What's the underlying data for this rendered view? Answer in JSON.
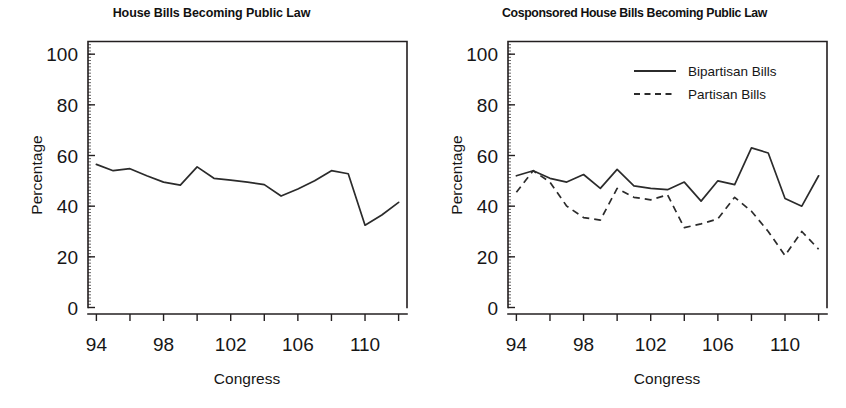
{
  "figure": {
    "background": "#ffffff",
    "ink_color": "#231f20"
  },
  "panels": [
    {
      "id": "left",
      "title": "House Bills Becoming Public Law",
      "xlabel": "Congress",
      "ylabel": "Percentage",
      "has_legend": false
    },
    {
      "id": "right",
      "title": "Cosponsored House Bills Becoming Public Law",
      "xlabel": "Congress",
      "ylabel": "Percentage",
      "has_legend": true,
      "legend": [
        {
          "label": "Bipartisan Bills",
          "style": "solid"
        },
        {
          "label": "Partisan Bills",
          "style": "dashed"
        }
      ]
    }
  ],
  "axes": {
    "y_ticks": [
      "0",
      "20",
      "40",
      "60",
      "80",
      "100"
    ],
    "y_tick_values": [
      0,
      20,
      40,
      60,
      80,
      100
    ],
    "x_ticks": [
      "94",
      "98",
      "102",
      "106",
      "110"
    ],
    "x_tick_values": [
      94,
      98,
      102,
      106,
      110
    ],
    "ylim": [
      0,
      105
    ],
    "xlim": [
      93.5,
      112.5
    ],
    "grid": false
  },
  "chart_data": [
    {
      "type": "line",
      "title": "House Bills Becoming Public Law",
      "xlabel": "Congress",
      "ylabel": "Percentage",
      "ylim": [
        0,
        105
      ],
      "xlim": [
        93.5,
        112.5
      ],
      "grid": false,
      "legend_position": "none",
      "x": [
        94,
        95,
        96,
        97,
        98,
        99,
        100,
        101,
        102,
        103,
        104,
        105,
        106,
        107,
        108,
        109,
        110,
        111,
        112
      ],
      "series": [
        {
          "name": "All House Bills",
          "style": "solid",
          "values": [
            56.5,
            54.0,
            54.8,
            52.0,
            49.5,
            48.3,
            55.5,
            51.0,
            50.3,
            49.5,
            48.5,
            44.0,
            46.8,
            50.0,
            54.0,
            52.8,
            32.5,
            36.5,
            41.5
          ]
        }
      ]
    },
    {
      "type": "line",
      "title": "Cosponsored House Bills Becoming Public Law",
      "xlabel": "Congress",
      "ylabel": "Percentage",
      "ylim": [
        0,
        105
      ],
      "xlim": [
        93.5,
        112.5
      ],
      "grid": false,
      "legend_position": "top-right",
      "x": [
        94,
        95,
        96,
        97,
        98,
        99,
        100,
        101,
        102,
        103,
        104,
        105,
        106,
        107,
        108,
        109,
        110,
        111,
        112
      ],
      "series": [
        {
          "name": "Bipartisan Bills",
          "style": "solid",
          "values": [
            52.0,
            54.0,
            51.0,
            49.5,
            52.5,
            47.0,
            54.5,
            48.0,
            47.0,
            46.5,
            49.5,
            42.0,
            50.0,
            48.5,
            63.0,
            61.0,
            43.0,
            40.0,
            52.0
          ]
        },
        {
          "name": "Partisan Bills",
          "style": "dashed",
          "values": [
            45.5,
            54.0,
            49.5,
            40.0,
            35.5,
            34.5,
            47.0,
            43.5,
            42.5,
            44.5,
            31.5,
            33.0,
            35.0,
            43.5,
            38.0,
            30.0,
            20.5,
            30.0,
            23.0
          ]
        }
      ]
    }
  ]
}
